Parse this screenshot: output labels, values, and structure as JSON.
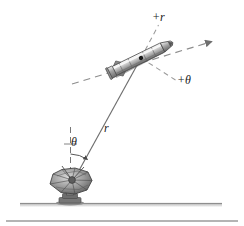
{
  "figure": {
    "caption": "",
    "background_color": "#ffffff",
    "ink_color": "#3b3b3b",
    "labels": {
      "plus_r": "+r",
      "plus_theta": "+θ",
      "r": "r",
      "theta": "θ"
    },
    "elements": {
      "ground_line": "ground-line",
      "bottom_rule": "bottom-rule",
      "radar_dish": "radar-dish",
      "missile": "missile",
      "range_line": "range-line",
      "vertical_reference": "vertical-reference-dashed-line",
      "angle_arc": "angle-arc",
      "trajectory_axis": "trajectory-axis-dashed-arrow",
      "plus_r_leader": "plus-r-leader-dashed-line",
      "plus_theta_leader": "plus-theta-leader-dashed-line",
      "missile-center-dot": "missile-center-dot"
    },
    "geometry": {
      "dish_origin": [
        70,
        186
      ],
      "missile_center": [
        141,
        58
      ],
      "missile_tail": [
        111,
        73
      ],
      "missile_nose": [
        170,
        44
      ],
      "axis_arrow_tip": [
        216,
        41
      ],
      "axis_dashed_start": [
        72,
        84
      ],
      "plus_r_tip": [
        159,
        25
      ],
      "plus_theta_tip": [
        176,
        80
      ],
      "ground_y": 205,
      "vertical_top": [
        70,
        127
      ],
      "theta_arc_radius": 32
    }
  }
}
